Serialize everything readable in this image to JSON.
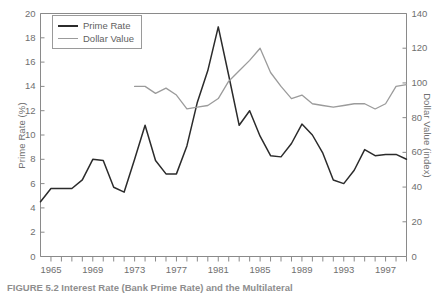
{
  "figure": {
    "caption": "FIGURE 5.2 Interest Rate (Bank Prime Rate) and the Multilateral"
  },
  "legend": {
    "position": "top-left",
    "entries": [
      {
        "label": "Prime Rate",
        "color": "#2b2b2b"
      },
      {
        "label": "Dollar Value",
        "color": "#9b9b9b"
      }
    ]
  },
  "axes": {
    "left": {
      "title": "Prime Rate (%)",
      "ticks": [
        "0",
        "2",
        "4",
        "6",
        "8",
        "10",
        "12",
        "14",
        "16",
        "18",
        "20"
      ]
    },
    "right": {
      "title": "Dollar Value (index)",
      "ticks": [
        "0",
        "20",
        "40",
        "60",
        "80",
        "100",
        "120",
        "140"
      ]
    },
    "bottom": {
      "title": "",
      "ticks": [
        "1965",
        "1969",
        "1973",
        "1977",
        "1981",
        "1985",
        "1989",
        "1993",
        "1997"
      ]
    }
  },
  "chart_data": {
    "type": "line",
    "title": "",
    "subtitle": "",
    "xlabel": "",
    "ylabel": "Prime Rate (%)",
    "y2label": "Dollar Value (index)",
    "xlim": [
      1964,
      1999
    ],
    "ylim": [
      0,
      20
    ],
    "y2lim": [
      0,
      140
    ],
    "grid": false,
    "legend_position": "top-left",
    "xticks": [
      1965,
      1969,
      1973,
      1977,
      1981,
      1985,
      1989,
      1993,
      1997
    ],
    "xticks_minor_step": 1,
    "yticks": [
      0,
      2,
      4,
      6,
      8,
      10,
      12,
      14,
      16,
      18,
      20
    ],
    "y2ticks": [
      0,
      20,
      40,
      60,
      80,
      100,
      120,
      140
    ],
    "series": [
      {
        "name": "Prime Rate",
        "axis": "left",
        "color": "#2b2b2b",
        "x": [
          1964,
          1965,
          1966,
          1967,
          1968,
          1969,
          1970,
          1971,
          1972,
          1973,
          1974,
          1975,
          1976,
          1977,
          1978,
          1979,
          1980,
          1981,
          1982,
          1983,
          1984,
          1985,
          1986,
          1987,
          1988,
          1989,
          1990,
          1991,
          1992,
          1993,
          1994,
          1995,
          1996,
          1997,
          1998,
          1999
        ],
        "values": [
          4.5,
          5.6,
          5.6,
          5.6,
          6.3,
          8.0,
          7.9,
          5.7,
          5.3,
          8.0,
          10.8,
          7.9,
          6.8,
          6.8,
          9.1,
          12.7,
          15.3,
          18.9,
          14.9,
          10.8,
          12.0,
          9.9,
          8.3,
          8.2,
          9.3,
          10.9,
          10.0,
          8.5,
          6.3,
          6.0,
          7.1,
          8.8,
          8.3,
          8.4,
          8.4,
          8.0
        ]
      },
      {
        "name": "Dollar Value",
        "axis": "right",
        "color": "#9b9b9b",
        "x": [
          1973,
          1974,
          1975,
          1976,
          1977,
          1978,
          1979,
          1980,
          1981,
          1982,
          1983,
          1984,
          1985,
          1986,
          1987,
          1988,
          1989,
          1990,
          1991,
          1992,
          1993,
          1994,
          1995,
          1996,
          1997,
          1998,
          1999
        ],
        "values": [
          98,
          98,
          94,
          97,
          93,
          85,
          86,
          87,
          91,
          101,
          107,
          113,
          120,
          106,
          98,
          91,
          93,
          88,
          87,
          86,
          87,
          88,
          88,
          85,
          88,
          98,
          99
        ]
      }
    ]
  }
}
